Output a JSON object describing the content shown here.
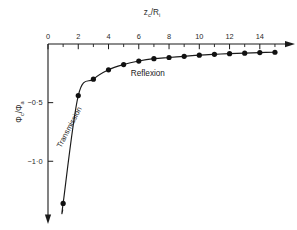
{
  "chart_data": {
    "type": "line",
    "title": "",
    "xlabel": "z_c/R_i",
    "xlabel_parts": {
      "base1": "z",
      "sub1": "c",
      "slash": "/",
      "base2": "R",
      "sub2": "i"
    },
    "ylabel": "Φ_c/Φ_a",
    "ylabel_parts": {
      "base1": "Φ",
      "sub1": "c",
      "slash": "/",
      "base2": "Φ",
      "sub2": "a"
    },
    "xlim": [
      0,
      15.4
    ],
    "ylim": [
      -1.45,
      0.06
    ],
    "x_axis_position": "top",
    "y_axis_direction": "down",
    "grid": false,
    "legend": "none",
    "x_major_ticks": [
      0,
      2,
      4,
      6,
      8,
      10,
      12,
      14
    ],
    "x_major_tick_labels": [
      "0",
      "2",
      "4",
      "6",
      "8",
      "10",
      "12",
      "14"
    ],
    "x_minor_ticks": [
      1,
      3,
      5,
      7,
      9,
      11,
      13,
      15
    ],
    "y_major_ticks": [
      -0.5,
      -1.0
    ],
    "y_major_tick_labels": [
      "−0·5",
      "−1·0"
    ],
    "series": [
      {
        "name": "phi_c over phi_a",
        "marker": "filled-circle",
        "x": [
          1,
          2,
          3,
          4,
          5,
          6,
          7,
          8,
          9,
          10,
          11,
          12,
          13,
          14,
          15
        ],
        "values": [
          -1.36,
          -0.44,
          -0.3,
          -0.22,
          -0.175,
          -0.145,
          -0.125,
          -0.115,
          -0.105,
          -0.095,
          -0.088,
          -0.082,
          -0.078,
          -0.073,
          -0.07
        ]
      }
    ],
    "annotations": [
      {
        "text": "Transmission",
        "x": 1.55,
        "y": -0.72,
        "rotation": -62
      },
      {
        "text": "Reflexion",
        "x": 6.6,
        "y": -0.27,
        "rotation": 0
      }
    ],
    "arrowheads": {
      "x_axis_end": "right",
      "y_axis_end": "bottom"
    },
    "colors": {
      "axis": "#1a1a1a",
      "curve": "#1a1a1a",
      "marker": "#111111",
      "background": "#ffffff"
    }
  }
}
